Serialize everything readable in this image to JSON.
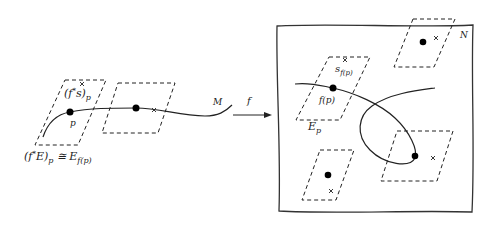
{
  "diagram": {
    "left": {
      "manifold_label": "M",
      "point_label": "p",
      "section_label": "(f*s)p",
      "fiber_label": "(f*E)p ≅ Ef(p)"
    },
    "arrow": {
      "label": "f"
    },
    "right": {
      "manifold_label": "N",
      "section_label": "sf(p)",
      "point_label": "f(p)",
      "fiber_label": "Ep"
    },
    "colors": {
      "ink": "#222222",
      "background": "#ffffff"
    }
  }
}
